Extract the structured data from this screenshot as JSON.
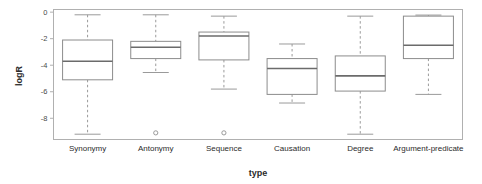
{
  "chart_data": {
    "type": "box",
    "title": "",
    "xlabel": "type",
    "ylabel": "logR",
    "ylim": [
      -9.6,
      0.2
    ],
    "yticks": [
      0,
      -2,
      -4,
      -6,
      -8
    ],
    "ytick_labels": [
      "0",
      "-2",
      "-4",
      "-6",
      "-8"
    ],
    "grid": false,
    "legend": "none",
    "categories": [
      "Synonymy",
      "Antonymy",
      "Sequence",
      "Causation",
      "Degree",
      "Argument-predicate"
    ],
    "boxes": [
      {
        "category": "Synonymy",
        "whisker_high": -0.2,
        "q3": -2.1,
        "median": -3.7,
        "q1": -5.1,
        "whisker_low": -9.2,
        "outliers": []
      },
      {
        "category": "Antonymy",
        "whisker_high": -0.2,
        "q3": -2.2,
        "median": -2.65,
        "q1": -3.5,
        "whisker_low": -4.55,
        "outliers": [
          -9.1
        ]
      },
      {
        "category": "Sequence",
        "whisker_high": -0.3,
        "q3": -1.5,
        "median": -1.8,
        "q1": -3.6,
        "whisker_low": -5.8,
        "outliers": [
          -9.1
        ]
      },
      {
        "category": "Causation",
        "whisker_high": -2.4,
        "q3": -3.5,
        "median": -4.25,
        "q1": -6.2,
        "whisker_low": -6.85,
        "outliers": []
      },
      {
        "category": "Degree",
        "whisker_high": -0.3,
        "q3": -3.3,
        "median": -4.8,
        "q1": -5.95,
        "whisker_low": -9.2,
        "outliers": []
      },
      {
        "category": "Argument-predicate",
        "whisker_high": -0.22,
        "q3": -0.3,
        "median": -2.5,
        "q1": -3.5,
        "whisker_low": -6.2,
        "outliers": []
      }
    ],
    "colors": {
      "box_stroke": "#8c8c8c",
      "median_stroke": "#6b6b6b",
      "whisker_stroke": "#9a9a9a",
      "cap_stroke": "#9a9a9a",
      "outlier_stroke": "#9a9a9a",
      "frame_stroke": "#b0b0b0",
      "background": "#ffffff",
      "text": "#2b2b2b"
    }
  }
}
